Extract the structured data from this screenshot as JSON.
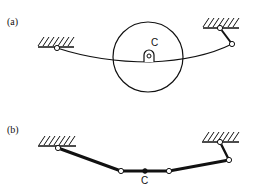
{
  "figure": {
    "panel_a": {
      "label": "(a)",
      "point_label": "C",
      "description": "Cable with pulley/disk attached at point C, anchored to two ground supports"
    },
    "panel_b": {
      "label": "(b)",
      "point_label": "C",
      "description": "Equivalent linkage chain with hinged links between two ground supports"
    },
    "colors": {
      "ink": "#111111",
      "background": "#ffffff"
    }
  }
}
